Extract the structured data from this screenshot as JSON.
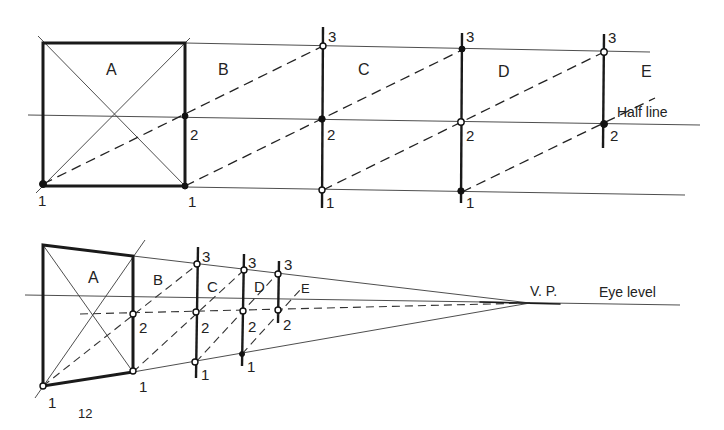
{
  "figure": {
    "page_number": "12",
    "top_diagram": {
      "section_labels": [
        "A",
        "B",
        "C",
        "D",
        "E"
      ],
      "point_labels": {
        "one": "1",
        "two": "2",
        "three": "3"
      },
      "half_line_label": "Half line"
    },
    "bottom_diagram": {
      "section_labels": [
        "A",
        "B",
        "C",
        "D",
        "E"
      ],
      "point_labels": {
        "one": "1",
        "two": "2",
        "three": "3"
      },
      "vanishing_point_label": "V. P.",
      "eye_level_label": "Eye level"
    }
  }
}
